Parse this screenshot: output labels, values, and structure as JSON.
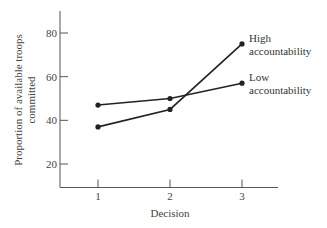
{
  "chart_data": {
    "type": "line",
    "title": "",
    "xlabel": "Decision",
    "ylabel": "Proportion of available troops committed",
    "ylabel_lines": [
      "Proportion of available troops",
      "committed"
    ],
    "categories": [
      "1",
      "2",
      "3"
    ],
    "x": [
      1,
      2,
      3
    ],
    "yticks": [
      20,
      40,
      60,
      80
    ],
    "ylim": [
      9,
      92
    ],
    "grid": false,
    "legend_position": "inline-right",
    "series": [
      {
        "name": "High accountability",
        "label_lines": [
          "High",
          "accountability"
        ],
        "values": [
          37,
          45,
          75
        ]
      },
      {
        "name": "Low accountability",
        "label_lines": [
          "Low",
          "accountability"
        ],
        "values": [
          47,
          50,
          57
        ]
      }
    ]
  }
}
